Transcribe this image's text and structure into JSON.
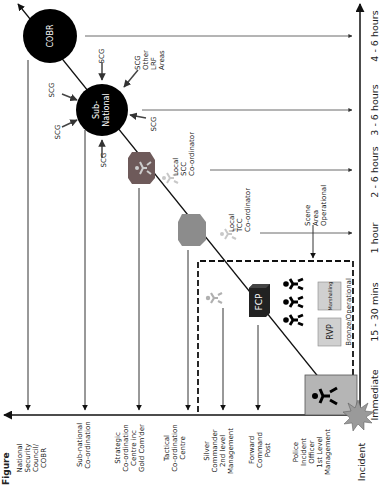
{
  "figure_caption": "Figure",
  "x_axis_label": "Incident",
  "levels": [
    {
      "id": "national",
      "lines": [
        "National",
        "Security",
        "Council/",
        "COBR"
      ]
    },
    {
      "id": "sub-national",
      "lines": [
        "Sub-national",
        "Co-ordination"
      ]
    },
    {
      "id": "strategic",
      "lines": [
        "Strategic",
        "Co-ordination",
        "Centre inc",
        "Gold Com'der"
      ]
    },
    {
      "id": "tactical",
      "lines": [
        "Tactical",
        "Co-ordination",
        "Centre"
      ]
    },
    {
      "id": "silver",
      "lines": [
        "Silver",
        "Commander",
        "2nd level",
        "Management"
      ]
    },
    {
      "id": "forward",
      "lines": [
        "Forward",
        "Command",
        "Post"
      ]
    },
    {
      "id": "police",
      "lines": [
        "Police",
        "Incident",
        "Officer",
        "1st Level",
        "Management"
      ]
    }
  ],
  "timeline": [
    {
      "id": "immediate",
      "label": "Immediate"
    },
    {
      "id": "15-30",
      "label": "15 - 30 mins"
    },
    {
      "id": "1h",
      "label": "1 hour"
    },
    {
      "id": "2-6h",
      "label": "2 - 6 hours"
    },
    {
      "id": "3-6h",
      "label": "3 - 6 hours"
    },
    {
      "id": "4-6h",
      "label": "4 - 6 hours"
    }
  ],
  "nodes": {
    "cobr": "COBR",
    "sub_national": [
      "Sub-",
      "National"
    ],
    "fcp": "FCP",
    "rvp": "RVP",
    "marshalling": "Marshalling",
    "bronze": "Bronze/Operational"
  },
  "scg_labels": [
    "SCG",
    "SCG",
    "SCG",
    "SCG",
    "SCG"
  ],
  "scg_other": [
    "SCG",
    "Other",
    "LRF",
    "Areas"
  ],
  "local_scc": [
    "Local",
    "SCC",
    "Co-ordinator"
  ],
  "local_tcc": [
    "Local",
    "TCC",
    "Co-ordinator"
  ],
  "scene_area": [
    "Scene",
    "Area",
    "Operational"
  ],
  "colors": {
    "black": "#000000",
    "node_grey": "#8c8c8c",
    "box_grey": "#b5b5b5",
    "light_grey": "#c8c8c8",
    "star": "#9a9a9a",
    "dark_red_grey": "#6e5a5a"
  }
}
